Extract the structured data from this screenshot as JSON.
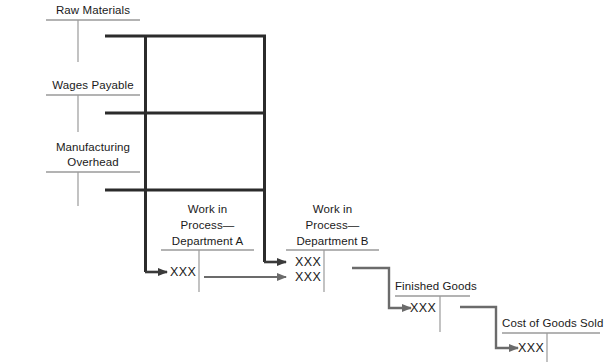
{
  "diagram": {
    "colors": {
      "text": "#1a1a1a",
      "light_rule": "#9a9a9a",
      "heavy_line": "#2b2b2b",
      "arrow_line": "#6b6b6b",
      "background": "#ffffff"
    }
  },
  "accounts": {
    "raw_materials": {
      "label": "Raw Materials",
      "amount": ""
    },
    "wages_payable": {
      "label": "Wages Payable",
      "amount": ""
    },
    "manufacturing_overhead": {
      "label_line1": "Manufacturing",
      "label_line2": "Overhead",
      "amount": ""
    },
    "wip_dept_a": {
      "label_line1": "Work in",
      "label_line2": "Process—",
      "label_line3": "Department A",
      "debit_amount": "XXX"
    },
    "wip_dept_b": {
      "label_line1": "Work in",
      "label_line2": "Process—",
      "label_line3": "Department B",
      "debit_amount_1": "XXX",
      "debit_amount_2": "XXX"
    },
    "finished_goods": {
      "label": "Finished Goods",
      "debit_amount": "XXX"
    },
    "cost_of_goods_sold": {
      "label": "Cost of Goods Sold",
      "debit_amount": "XXX"
    }
  }
}
